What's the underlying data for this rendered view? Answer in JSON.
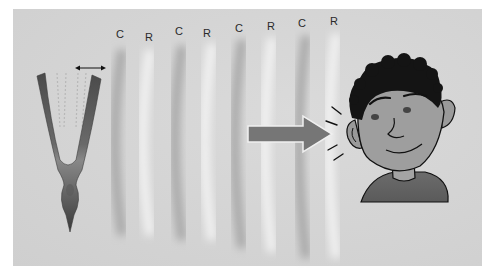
{
  "diagram": {
    "band_labels": [
      {
        "text": "C",
        "meaning": "compression",
        "x": 116,
        "y": 28
      },
      {
        "text": "R",
        "meaning": "rarefaction",
        "x": 145,
        "y": 31
      },
      {
        "text": "C",
        "meaning": "compression",
        "x": 175,
        "y": 25
      },
      {
        "text": "R",
        "meaning": "rarefaction",
        "x": 203,
        "y": 27
      },
      {
        "text": "C",
        "meaning": "compression",
        "x": 235,
        "y": 22
      },
      {
        "text": "R",
        "meaning": "rarefaction",
        "x": 267,
        "y": 20
      },
      {
        "text": "C",
        "meaning": "compression",
        "x": 298,
        "y": 17
      },
      {
        "text": "R",
        "meaning": "rarefaction",
        "x": 330,
        "y": 15
      }
    ],
    "elements": {
      "tuning_fork": "vibrating tuning fork",
      "vibration_arrow": "double-headed arrow",
      "direction_arrow": "right arrow toward ear",
      "listener": "cartoon boy listening",
      "sound_lines": "sound emphasis lines at ear"
    },
    "colors": {
      "background": "#d4d4d4",
      "compression": "#a9a9a9",
      "rarefaction": "#f2f2f2",
      "fork_dark": "#4a4a4a",
      "fork_light": "#8a8a8a",
      "arrow": "#7a7a7a",
      "skin": "#9e9e9e",
      "hair": "#141414",
      "shirt": "#6a6a6a"
    }
  }
}
